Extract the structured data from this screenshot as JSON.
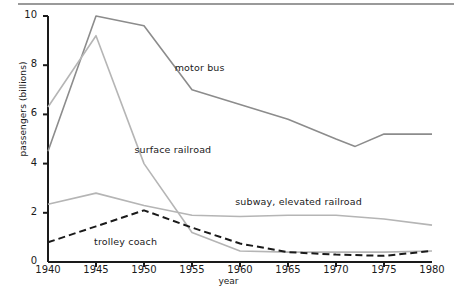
{
  "chart_data": {
    "type": "line",
    "title": "",
    "xlabel": "year",
    "ylabel": "passengers (billions)",
    "xlim": [
      1940,
      1980
    ],
    "ylim": [
      0,
      10
    ],
    "grid": false,
    "legend_position": "inline-annotations",
    "xticks": [
      "1940",
      "1945",
      "1950",
      "1955",
      "1960",
      "1965",
      "1970",
      "1975",
      "1980"
    ],
    "yticks": [
      "0",
      "2",
      "4",
      "6",
      "8",
      "10"
    ],
    "x": [
      1940,
      1945,
      1950,
      1955,
      1960,
      1965,
      1970,
      1972,
      1975,
      1980
    ],
    "series": [
      {
        "name": "motor bus",
        "color": "#8c8c8c",
        "style": "solid",
        "x": [
          1940,
          1945,
          1950,
          1955,
          1960,
          1965,
          1970,
          1972,
          1975,
          1980
        ],
        "values": [
          4.5,
          10.0,
          9.6,
          7.0,
          6.4,
          5.8,
          5.0,
          4.7,
          5.2,
          5.2
        ]
      },
      {
        "name": "surface railroad",
        "color": "#b5b5b5",
        "style": "solid",
        "x": [
          1940,
          1945,
          1950,
          1955,
          1960,
          1965,
          1970,
          1975,
          1980
        ],
        "values": [
          6.3,
          9.2,
          4.0,
          1.2,
          0.45,
          0.4,
          0.4,
          0.4,
          0.45
        ]
      },
      {
        "name": "subway, elevated railroad",
        "color": "#b5b5b5",
        "style": "solid",
        "x": [
          1940,
          1945,
          1950,
          1955,
          1960,
          1965,
          1970,
          1975,
          1980
        ],
        "values": [
          2.35,
          2.8,
          2.3,
          1.9,
          1.85,
          1.9,
          1.9,
          1.75,
          1.5
        ]
      },
      {
        "name": "trolley coach",
        "color": "#1a1a1a",
        "style": "dashed",
        "x": [
          1940,
          1945,
          1950,
          1955,
          1960,
          1965,
          1970,
          1975,
          1980
        ],
        "values": [
          0.8,
          1.45,
          2.1,
          1.4,
          0.75,
          0.4,
          0.3,
          0.25,
          0.45
        ]
      }
    ],
    "annotations": [
      {
        "text": "motor bus",
        "x": 1953.2,
        "y": 7.9
      },
      {
        "text": "surface railroad",
        "x": 1949.0,
        "y": 4.55
      },
      {
        "text": "subway, elevated railroad",
        "x": 1959.5,
        "y": 2.45
      },
      {
        "text": "trolley coach",
        "x": 1944.8,
        "y": 0.83
      }
    ]
  }
}
